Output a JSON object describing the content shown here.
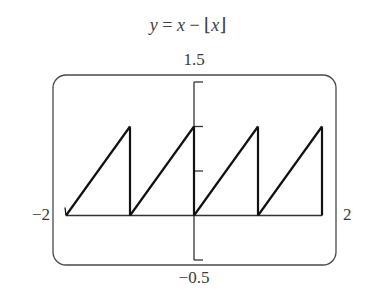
{
  "chart_data": {
    "type": "line",
    "title": "y = x − ⌊x⌋",
    "xlabel": "",
    "ylabel": "",
    "xlim": [
      -2,
      2
    ],
    "ylim": [
      -0.5,
      1.5
    ],
    "window_labels": {
      "ymax": "1.5",
      "ymin": "−0.5",
      "xmin": "−2",
      "xmax": "2"
    },
    "y_ticks": [
      0.5,
      1.0,
      1.5,
      -0.5
    ],
    "grid": false,
    "series": [
      {
        "name": "y = x − floor(x)",
        "x": [
          -2,
          -1,
          -1,
          -1,
          0,
          0,
          0,
          1,
          1,
          1,
          2,
          2
        ],
        "y": [
          0,
          1,
          0,
          0,
          1,
          0,
          0,
          1,
          0,
          0,
          1,
          0
        ],
        "segments": [
          {
            "x": [
              -2,
              -1
            ],
            "y": [
              0,
              1
            ]
          },
          {
            "x": [
              -1,
              0
            ],
            "y": [
              0,
              1
            ]
          },
          {
            "x": [
              0,
              1
            ],
            "y": [
              0,
              1
            ]
          },
          {
            "x": [
              1,
              2
            ],
            "y": [
              0,
              1
            ]
          }
        ],
        "connected_mode_verticals": [
          -1,
          0,
          1,
          2
        ]
      }
    ]
  },
  "title_parts": {
    "lhs": "y",
    "eq": " = ",
    "x": "x",
    "minus": " − ⌊",
    "x2": "x",
    "close": "⌋"
  }
}
